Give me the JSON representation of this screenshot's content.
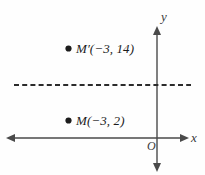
{
  "figure": {
    "kind": "coordinate-plane-reflection-diagram",
    "background_color": "#fefefe",
    "axis_color": "#4a4a4a",
    "ink_color": "#1c1c1c"
  },
  "axes": {
    "y_axis_label": "y",
    "x_axis_label": "x",
    "origin_label": "O"
  },
  "reflection_line": {
    "style": "dashed",
    "orientation": "horizontal"
  },
  "points": [
    {
      "id": "m-prime",
      "name": "M′",
      "coords": "(−3, 14)",
      "label": "M′(−3, 14)",
      "x": -3,
      "y": 14,
      "marker": "filled-dot"
    },
    {
      "id": "m",
      "name": "M",
      "coords": "(−3, 2)",
      "label": "M(−3, 2)",
      "x": -3,
      "y": 2,
      "marker": "filled-dot"
    }
  ]
}
